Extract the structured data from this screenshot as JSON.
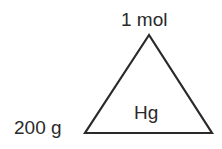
{
  "diagram": {
    "type": "formula-triangle",
    "top_label": "1 mol",
    "left_label": "200 g",
    "center_label": "Hg",
    "stroke_color": "#2a2a2a"
  }
}
